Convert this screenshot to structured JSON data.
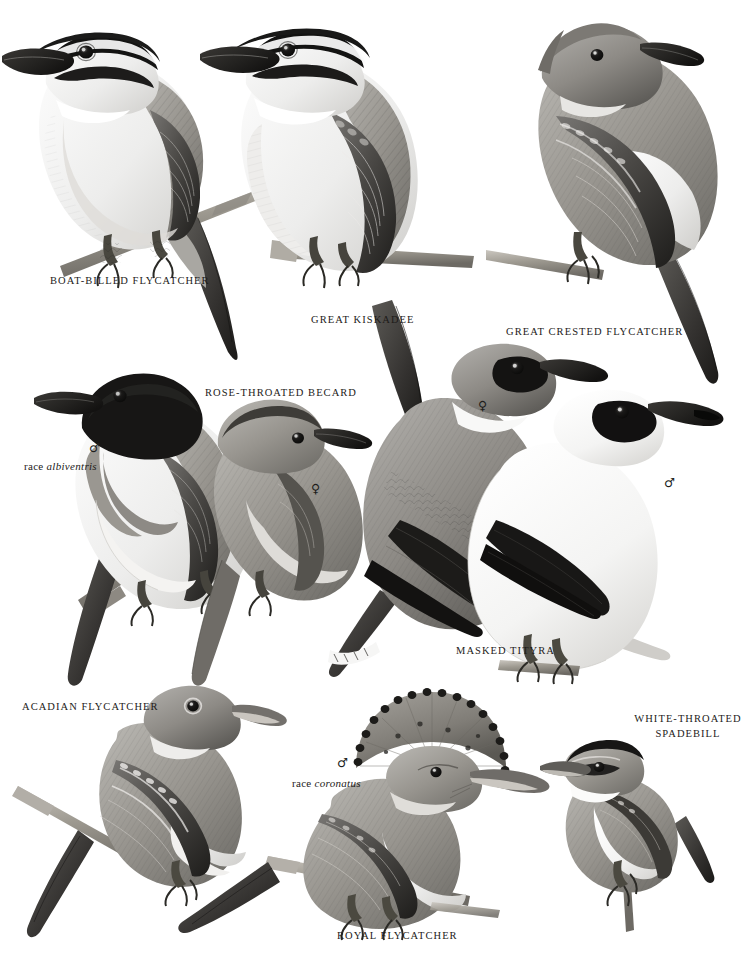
{
  "plate": {
    "kind": "bird-illustration-plate",
    "background_color": "#ffffff",
    "ink_color": "#1d1b19",
    "width": 755,
    "height": 953,
    "palette": {
      "black": "#1a1a1a",
      "dark_gray": "#4a4a4a",
      "mid_gray": "#8c8c8c",
      "light_gray": "#c9c9c9",
      "near_white": "#f2f2f2",
      "branch": "#9a958d"
    }
  },
  "labels": {
    "boat_billed_flycatcher": "BOAT-BILLED FLYCATCHER",
    "great_kiskadee": "GREAT KISKADEE",
    "great_crested_flycatcher": "GREAT CRESTED FLYCATCHER",
    "rose_throated_becard": "ROSE-THROATED BECARD",
    "masked_tityra": "MASKED TITYRA",
    "acadian_flycatcher": "ACADIAN FLYCATCHER",
    "white_throated_spadebill_line1": "WHITE-THROATED",
    "white_throated_spadebill_line2": "SPADEBILL",
    "royal_flycatcher": "ROYAL FLYCATCHER"
  },
  "annotations": {
    "race_albiventris_prefix": "race ",
    "race_albiventris_name": "albiventris",
    "race_coronatus_prefix": "race ",
    "race_coronatus_name": "coronatus",
    "male_symbol": "♂",
    "female_symbol": "♀"
  },
  "figures": [
    {
      "id": "boat-billed-flycatcher",
      "label": "BOAT-BILLED FLYCATCHER",
      "sex": null,
      "race": null
    },
    {
      "id": "great-kiskadee",
      "label": "GREAT KISKADEE",
      "sex": null,
      "race": null
    },
    {
      "id": "great-crested-flycatcher",
      "label": "GREAT CRESTED FLYCATCHER",
      "sex": null,
      "race": null
    },
    {
      "id": "rose-throated-becard-male",
      "label": "ROSE-THROATED BECARD",
      "sex": "♂",
      "race": "albiventris"
    },
    {
      "id": "rose-throated-becard-female",
      "label": "ROSE-THROATED BECARD",
      "sex": "♀",
      "race": null
    },
    {
      "id": "masked-tityra-female",
      "label": "MASKED TITYRA",
      "sex": "♀",
      "race": null
    },
    {
      "id": "masked-tityra-male",
      "label": "MASKED TITYRA",
      "sex": "♂",
      "race": null
    },
    {
      "id": "acadian-flycatcher",
      "label": "ACADIAN FLYCATCHER",
      "sex": null,
      "race": null
    },
    {
      "id": "royal-flycatcher",
      "label": "ROYAL FLYCATCHER",
      "sex": "♂",
      "race": "coronatus"
    },
    {
      "id": "white-throated-spadebill",
      "label": "WHITE-THROATED SPADEBILL",
      "sex": null,
      "race": null
    }
  ]
}
